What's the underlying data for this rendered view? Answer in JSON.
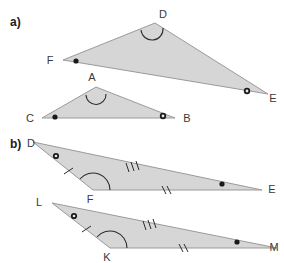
{
  "figure": {
    "width": 284,
    "height": 263,
    "background": "#ffffff",
    "triangle_fill": "#d6d6d6",
    "triangle_stroke": "#9a9a9a",
    "mark_color": "#2b2b2b"
  },
  "parts": [
    {
      "id": "a",
      "label": "a)",
      "label_pos": {
        "x": 10,
        "y": 26
      },
      "triangles": [
        {
          "name": "triangle-FDE",
          "points": "63,60 155,23 268,94",
          "vertices": [
            {
              "name": "F",
              "label": "F",
              "x": 63,
              "y": 60,
              "label_x": 50,
              "label_y": 64,
              "marker": "dot",
              "marker_x": 76,
              "marker_y": 61
            },
            {
              "name": "D",
              "label": "D",
              "x": 155,
              "y": 23,
              "label_x": 162,
              "label_y": 18,
              "marker": "arc",
              "marker_x": 152,
              "marker_y": 31
            },
            {
              "name": "E",
              "label": "E",
              "x": 268,
              "y": 94,
              "label_x": 270,
              "label_y": 101,
              "marker": "ring",
              "marker_x": 247,
              "marker_y": 91
            }
          ]
        },
        {
          "name": "triangle-CAB",
          "points": "42,118 96,87 175,118",
          "vertices": [
            {
              "name": "C",
              "label": "C",
              "x": 42,
              "y": 118,
              "label_x": 30,
              "label_y": 122,
              "marker": "dot",
              "marker_x": 55,
              "marker_y": 117
            },
            {
              "name": "A",
              "label": "A",
              "x": 96,
              "y": 87,
              "label_x": 91,
              "label_y": 81,
              "marker": "arc",
              "marker_x": 95,
              "marker_y": 94
            },
            {
              "name": "B",
              "label": "B",
              "x": 175,
              "y": 118,
              "label_x": 182,
              "label_y": 122,
              "marker": "ring",
              "marker_x": 163,
              "marker_y": 116
            }
          ]
        }
      ]
    },
    {
      "id": "b",
      "label": "b)",
      "label_pos": {
        "x": 10,
        "y": 148
      },
      "triangles": [
        {
          "name": "triangle-DFE",
          "points": "33,142 93,190 262,190",
          "vertices": [
            {
              "name": "D",
              "label": "D",
              "x": 33,
              "y": 142,
              "label_x": 31,
              "label_y": 147,
              "marker": "ring",
              "marker_x": 54,
              "marker_y": 155
            },
            {
              "name": "F",
              "label": "F",
              "x": 93,
              "y": 190,
              "label_x": 88,
              "label_y": 202,
              "marker": "arc-big",
              "marker_x": 93,
              "marker_y": 190
            },
            {
              "name": "E",
              "label": "E",
              "x": 262,
              "y": 190,
              "label_x": 267,
              "label_y": 193,
              "marker": "dot",
              "marker_x": 222,
              "marker_y": 184
            }
          ],
          "side_ticks": [
            {
              "name": "tick-DE",
              "count": 3,
              "x": 131,
              "y": 166,
              "angle": 15
            },
            {
              "name": "tick-FE",
              "count": 2,
              "x": 165,
              "y": 190,
              "angle": 0
            },
            {
              "name": "tick-DF",
              "count": 1,
              "x": 68,
              "y": 172,
              "angle": -38
            }
          ]
        },
        {
          "name": "triangle-LKM",
          "points": "52,203 110,248 277,248",
          "vertices": [
            {
              "name": "L",
              "label": "L",
              "x": 52,
              "y": 203,
              "label_x": 38,
              "label_y": 206,
              "marker": "ring",
              "marker_x": 72,
              "marker_y": 215
            },
            {
              "name": "K",
              "label": "K",
              "x": 110,
              "y": 248,
              "label_x": 105,
              "label_y": 259,
              "marker": "arc-big",
              "marker_x": 110,
              "marker_y": 248
            },
            {
              "name": "M",
              "label": "M",
              "x": 277,
              "y": 248,
              "label_x": 272,
              "label_y": 251,
              "marker": "dot",
              "marker_x": 237,
              "marker_y": 242
            }
          ],
          "side_ticks": [
            {
              "name": "tick-LM",
              "count": 3,
              "x": 148,
              "y": 224,
              "angle": 15
            },
            {
              "name": "tick-KM",
              "count": 2,
              "x": 182,
              "y": 248,
              "angle": 0
            },
            {
              "name": "tick-LK",
              "count": 1,
              "x": 86,
              "y": 230,
              "angle": -38
            }
          ]
        }
      ]
    }
  ],
  "labels": {
    "part_a": "a)",
    "part_b": "b)",
    "a_tri1": [
      "F",
      "D",
      "E"
    ],
    "a_tri2": [
      "C",
      "A",
      "B"
    ],
    "b_tri1": [
      "D",
      "F",
      "E"
    ],
    "b_tri2": [
      "L",
      "K",
      "M"
    ]
  }
}
